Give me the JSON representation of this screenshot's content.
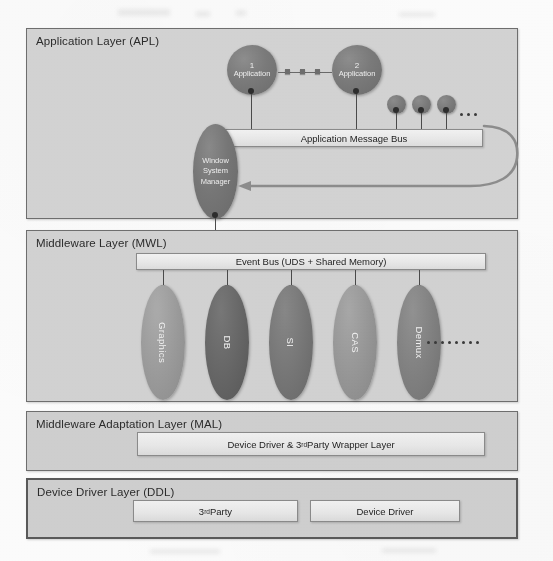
{
  "diagram": {
    "layers": [
      {
        "id": "apl",
        "title": "Application Layer (APL)"
      },
      {
        "id": "mwl",
        "title": "Middleware Layer (MWL)"
      },
      {
        "id": "mal",
        "title": "Middleware Adaptation Layer (MAL)"
      },
      {
        "id": "ddl",
        "title": "Device Driver Layer (DDL)"
      }
    ]
  },
  "application_layer": {
    "title": "Application Layer (APL)",
    "bus_label": "Application Message Bus",
    "window_system_manager": {
      "line1": "Window",
      "line2": "System",
      "line3": "Manager"
    },
    "applications": [
      {
        "number": "1",
        "label": "Application"
      },
      {
        "number": "2",
        "label": "Application"
      }
    ],
    "extra_nodes": 3,
    "ellipsis": "..."
  },
  "middleware_layer": {
    "title": "Middleware Layer (MWL)",
    "bus_label": "Event Bus (UDS  +  Shared Memory)",
    "components": [
      {
        "label": "Graphics",
        "color": "#9a9a9a"
      },
      {
        "label": "DB",
        "color": "#666666"
      },
      {
        "label": "SI",
        "color": "#767676"
      },
      {
        "label": "CAS",
        "color": "#969696"
      },
      {
        "label": "Demux",
        "color": "#808080"
      }
    ],
    "ellipsis_dots": 8
  },
  "middleware_adaptation_layer": {
    "title": "Middleware Adaptation Layer (MAL)",
    "box_label_pre": "Device  Driver  &  3",
    "box_label_sup": "rd",
    "box_label_post": "  Party  Wrapper  Layer"
  },
  "device_driver_layer": {
    "title": "Device Driver Layer (DDL)",
    "third_party_pre": "3",
    "third_party_sup": "rd",
    "third_party_post": " Party",
    "device_driver_label": "Device  Driver"
  },
  "colors": {
    "layer_fill": "#d2d2d2",
    "layer_border": "#6f6f6f",
    "bus_fill": "#ededed",
    "node_dark": "#6d6d6d",
    "arrow": "#8b8b8b",
    "text": "#2b2b2b"
  }
}
